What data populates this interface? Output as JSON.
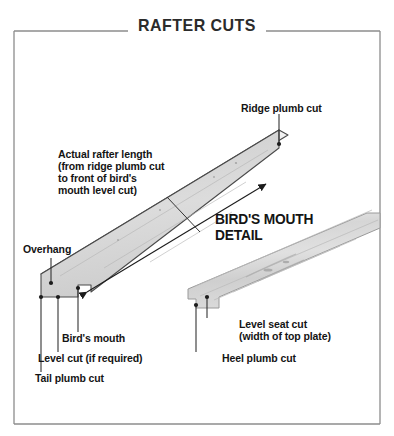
{
  "figure": {
    "title": "RAFTER CUTS",
    "frame_color": "#8c8c8c",
    "board_fill": "#d7d7d7",
    "board_top_fill": "#ececec",
    "board_edge": "#4a4a4a",
    "leader_color": "#333333",
    "text_color": "#141414"
  },
  "labels": {
    "ridge_plumb_cut": "Ridge plumb cut",
    "actual_rafter_length_l1": "Actual rafter length",
    "actual_rafter_length_l2": "(from ridge plumb cut",
    "actual_rafter_length_l3": "to front of bird's",
    "actual_rafter_length_l4": "mouth level cut)",
    "birds_mouth_detail_l1": "BIRD'S MOUTH",
    "birds_mouth_detail_l2": "DETAIL",
    "overhang": "Overhang",
    "birds_mouth": "Bird's mouth",
    "level_cut": "Level cut (if required)",
    "tail_plumb_cut": "Tail plumb cut",
    "level_seat_cut_l1": "Level seat cut",
    "level_seat_cut_l2": "(width of top plate)",
    "heel_plumb_cut": "Heel plumb cut"
  }
}
